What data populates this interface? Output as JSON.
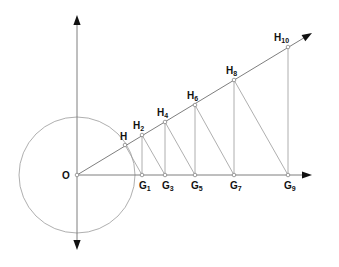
{
  "diagram": {
    "type": "geometric-construction",
    "colors": {
      "line": "#9a9a9a",
      "axis": "#6f6f6f",
      "arrow": "#111111",
      "label": "#111111"
    },
    "origin": {
      "id": "O",
      "label": "O",
      "x": 77,
      "y": 175,
      "label_x": 62,
      "label_y": 179
    },
    "circle": {
      "cx": 77,
      "cy": 175,
      "r": 58
    },
    "axes": {
      "vertical": {
        "x": 77,
        "y_top": 15,
        "y_bottom": 250
      },
      "horizontal": {
        "y": 175,
        "x_start": 77,
        "x_end": 312
      },
      "ray": {
        "x1": 77,
        "y1": 175,
        "x2": 312,
        "y2": 33
      }
    },
    "h_points": [
      {
        "id": "H",
        "base": "H",
        "sub": "",
        "x": 125,
        "y": 145,
        "label_x": 120,
        "label_y": 140
      },
      {
        "id": "H2",
        "base": "H",
        "sub": "2",
        "x": 142,
        "y": 135,
        "label_x": 133,
        "label_y": 129
      },
      {
        "id": "H4",
        "base": "H",
        "sub": "4",
        "x": 165,
        "y": 122,
        "label_x": 157,
        "label_y": 116
      },
      {
        "id": "H6",
        "base": "H",
        "sub": "6",
        "x": 195,
        "y": 105,
        "label_x": 187,
        "label_y": 99
      },
      {
        "id": "H8",
        "base": "H",
        "sub": "8",
        "x": 234,
        "y": 80,
        "label_x": 226,
        "label_y": 74
      },
      {
        "id": "H10",
        "base": "H",
        "sub": "10",
        "x": 288,
        "y": 47,
        "label_x": 274,
        "label_y": 41
      }
    ],
    "g_points": [
      {
        "id": "G1",
        "base": "G",
        "sub": "1",
        "x": 142,
        "y": 175,
        "label_x": 139,
        "label_y": 189
      },
      {
        "id": "G3",
        "base": "G",
        "sub": "3",
        "x": 165,
        "y": 175,
        "label_x": 162,
        "label_y": 189
      },
      {
        "id": "G5",
        "base": "G",
        "sub": "5",
        "x": 195,
        "y": 175,
        "label_x": 191,
        "label_y": 189
      },
      {
        "id": "G7",
        "base": "G",
        "sub": "7",
        "x": 234,
        "y": 175,
        "label_x": 230,
        "label_y": 189
      },
      {
        "id": "G9",
        "base": "G",
        "sub": "9",
        "x": 288,
        "y": 175,
        "label_x": 284,
        "label_y": 189
      }
    ],
    "segments": [
      {
        "from": "H",
        "to": "G1"
      },
      {
        "from": "H2",
        "to": "G1"
      },
      {
        "from": "H2",
        "to": "G3"
      },
      {
        "from": "H4",
        "to": "G3"
      },
      {
        "from": "H4",
        "to": "G5"
      },
      {
        "from": "H6",
        "to": "G5"
      },
      {
        "from": "H6",
        "to": "G7"
      },
      {
        "from": "H8",
        "to": "G7"
      },
      {
        "from": "H8",
        "to": "G9"
      },
      {
        "from": "H10",
        "to": "G9"
      }
    ]
  }
}
